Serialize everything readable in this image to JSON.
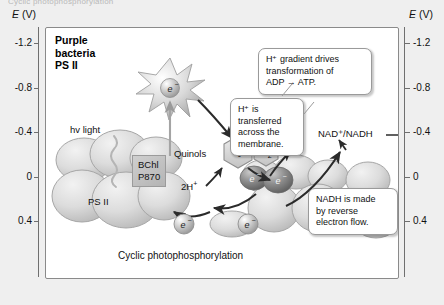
{
  "page": {
    "cut_off_header": "Cyclic photophosphorylation"
  },
  "axis": {
    "title_symbol": "E",
    "title_unit": "(V)",
    "title_left": "E (V)",
    "title_right": "E (V)",
    "ticks": [
      "-1.2",
      "-0.8",
      "-0.4",
      "0",
      "0.4"
    ],
    "tick_values": [
      -1.2,
      -0.8,
      -0.4,
      0,
      0.4
    ]
  },
  "panel": {
    "title_line1": "Purple",
    "title_line2": "bacteria",
    "title_line3": "PS II"
  },
  "labels": {
    "hv_light": "hv light",
    "quinols": "Quinols",
    "quinone": "Q",
    "hydrogen_molecule": "H",
    "hydrogen_molecule_sub": "2",
    "two_h_plus_left": "2H",
    "two_h_plus_right": "2H",
    "h_plus_sup": "+",
    "electron": "e",
    "electron_sup": "−",
    "nad_nadh": "NAD⁺/NADH",
    "ps_ii": "PS II",
    "bchl_line1": "BChl",
    "bchl_line2": "P870",
    "caption": "Cyclic photophosphorylation"
  },
  "callouts": [
    {
      "id": "atp-callout",
      "line1": "H⁺ gradient drives",
      "line2": "transformation of",
      "line3": "ADP → ATP."
    },
    {
      "id": "proton-callout",
      "line1": "H⁺ is",
      "line2": "transferred",
      "line3": "across the",
      "line4": "membrane."
    },
    {
      "id": "nadh-callout",
      "line1": "NADH is made",
      "line2": "by reverse",
      "line3": "electron flow."
    }
  ],
  "colors": {
    "page_background": "#efefef",
    "plot_background": "#ffffff",
    "frame_border": "#8a8a8a",
    "axis": "#6f6f6f",
    "text": "#111111",
    "arrow": "#2b2b2b",
    "complex_fill": "#d7d7d7",
    "electron_fill": "#bdbdbd",
    "cytochrome_fill": "#8c8c8c",
    "bchl_fill": "#c4c4c4"
  }
}
